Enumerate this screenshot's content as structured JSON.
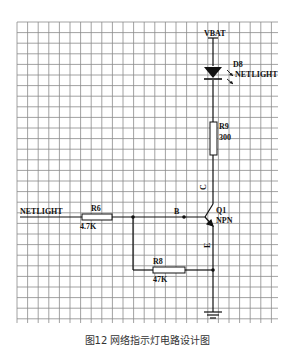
{
  "diagram": {
    "type": "circuit-schematic",
    "grid": {
      "x0": 17,
      "y0": 22,
      "x1": 278,
      "y1": 323,
      "spacing": 10.6,
      "color": "#8a8a8a"
    },
    "components": {
      "vbat": {
        "label": "VBAT"
      },
      "d8": {
        "ref": "D8",
        "value": "NETLIGHT",
        "kind": "LED"
      },
      "r9": {
        "ref": "R9",
        "value": "300"
      },
      "q1": {
        "ref": "Q1",
        "value": "NPN",
        "pin_c": "C",
        "pin_b": "B",
        "pin_e": "E"
      },
      "r6": {
        "ref": "R6",
        "value": "4.7K"
      },
      "r8": {
        "ref": "R8",
        "value": "47K"
      },
      "netlight_in": {
        "label": "NETLIGHT"
      },
      "ground": {
        "kind": "ground"
      }
    }
  },
  "caption": {
    "text": "图12   网络指示灯电路设计图"
  }
}
